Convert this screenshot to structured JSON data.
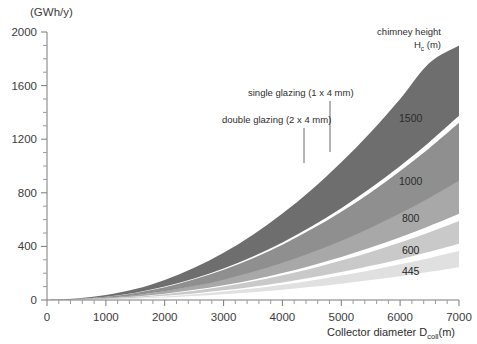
{
  "chart_data": {
    "type": "area",
    "title": "",
    "subtitle": "",
    "yunit_label": "(GWh/y)",
    "xlabel_main": "Collector diameter D",
    "xlabel_sub": "coll",
    "xlabel_tail": "(m)",
    "ylabel": "",
    "xlim": [
      0,
      7000
    ],
    "ylim": [
      0,
      2000
    ],
    "xticks": [
      0,
      1000,
      2000,
      3000,
      4000,
      5000,
      6000,
      7000
    ],
    "xticklabels": [
      "0",
      "1000",
      "2000",
      "3000",
      "4000",
      "5000",
      "6000",
      "7000"
    ],
    "yticks": [
      0,
      400,
      800,
      1200,
      1600,
      2000
    ],
    "yticklabels": [
      "0",
      "400",
      "800",
      "1200",
      "1600",
      "2000"
    ],
    "x_minor_step": 200,
    "y_minor_step": 100,
    "grid": false,
    "legend_position": "inline-right",
    "legend_title_line1": "chimney height",
    "legend_title_line2_main": "H",
    "legend_title_line2_sub": "c",
    "legend_title_line2_tail": "(m)",
    "annotations": [
      {
        "name": "single-glazing",
        "text": "single glazing (1 x 4 mm)",
        "text_x": 248,
        "text_y": 96,
        "leader_x": 330,
        "leader_y1": 101,
        "leader_y2": 152
      },
      {
        "name": "double-glazing",
        "text": "double glazing (2 x 4 mm)",
        "text_x": 222,
        "text_y": 123,
        "leader_x": 304,
        "leader_y1": 128,
        "leader_y2": 163
      }
    ],
    "series_note": "Each band spans from the double-glazing (lower) curve to the single-glazing (upper) curve for a given chimney height.",
    "x": [
      0,
      500,
      1000,
      1500,
      2000,
      2500,
      3000,
      3500,
      4000,
      4500,
      5000,
      5500,
      6000,
      6500,
      7000
    ],
    "series": [
      {
        "name": "1500",
        "label": "1500",
        "color": "#6e6e6e",
        "label_x": 6180,
        "label_y": 1330,
        "label_style": "light",
        "lower_values": [
          0,
          8,
          25,
          55,
          100,
          160,
          235,
          325,
          430,
          550,
          685,
          835,
          1000,
          1180,
          1375
        ],
        "upper_values": [
          0,
          12,
          38,
          82,
          150,
          240,
          352,
          487,
          645,
          825,
          1028,
          1252,
          1500,
          1770,
          1900
        ]
      },
      {
        "name": "1000",
        "label": "1000",
        "color": "#8f8f8f",
        "label_x": 6180,
        "label_y": 855,
        "label_style": "light",
        "lower_values": [
          0,
          5,
          16,
          36,
          65,
          104,
          152,
          210,
          278,
          356,
          443,
          540,
          647,
          763,
          889
        ],
        "upper_values": [
          0,
          7,
          24,
          53,
          96,
          154,
          226,
          312,
          413,
          529,
          659,
          803,
          962,
          1135,
          1323
        ]
      },
      {
        "name": "800",
        "label": "800",
        "color": "#a8a8a8",
        "label_x": 6180,
        "label_y": 585,
        "label_style": "light",
        "lower_values": [
          0,
          4,
          12,
          26,
          47,
          76,
          110,
          152,
          201,
          258,
          321,
          391,
          468,
          552,
          643
        ],
        "upper_values": [
          0,
          5,
          17,
          37,
          67,
          107,
          157,
          217,
          287,
          367,
          457,
          557,
          667,
          787,
          917
        ]
      },
      {
        "name": "600",
        "label": "600",
        "color": "#c9c9c9",
        "label_x": 6180,
        "label_y": 340,
        "label_style": "dark",
        "lower_values": [
          0,
          2,
          8,
          17,
          31,
          49,
          72,
          99,
          131,
          168,
          209,
          255,
          305,
          360,
          419
        ],
        "upper_values": [
          0,
          3,
          11,
          24,
          43,
          69,
          101,
          139,
          184,
          236,
          294,
          358,
          429,
          506,
          590
        ]
      },
      {
        "name": "445",
        "label": "445",
        "color": "#e0e0e0",
        "label_x": 6180,
        "label_y": 185,
        "label_style": "dark",
        "lower_values": [
          0,
          1,
          5,
          10,
          18,
          29,
          42,
          58,
          77,
          98,
          122,
          149,
          178,
          210,
          245
        ],
        "upper_values": [
          0,
          2,
          7,
          15,
          27,
          43,
          63,
          86,
          114,
          146,
          182,
          222,
          266,
          314,
          366
        ]
      }
    ]
  },
  "plot_geometry": {
    "left": 47,
    "right": 459,
    "top": 32,
    "bottom": 300
  }
}
